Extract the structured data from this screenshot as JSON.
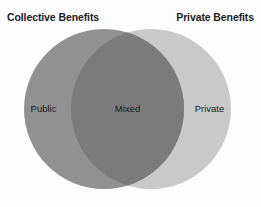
{
  "diagram": {
    "type": "venn",
    "background_color": "#fdfdfd",
    "headers": {
      "left": "Collective Benefits",
      "right": "Private Benefits"
    },
    "circles": [
      {
        "id": "collective",
        "label": "Public",
        "header": "Collective Benefits",
        "fill_color": "#919191",
        "cx": 104,
        "cy": 109,
        "r": 80
      },
      {
        "id": "private",
        "label": "Private",
        "header": "Private Benefits",
        "fill_color": "#c9c9c9",
        "cx": 151,
        "cy": 109,
        "r": 80
      }
    ],
    "intersection": {
      "id": "mixed",
      "label": "Mixed",
      "fill_color": "#7b7b7b"
    },
    "region_labels": {
      "left_only": "Public",
      "overlap": "Mixed",
      "right_only": "Private"
    }
  }
}
